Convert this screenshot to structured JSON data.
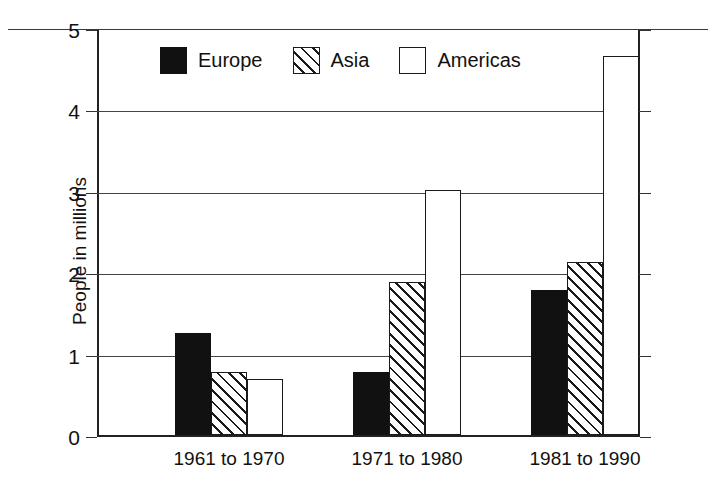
{
  "chart_data": {
    "type": "bar",
    "title": "",
    "subtitle": "",
    "xlabel": "",
    "ylabel": "People in millions",
    "categories": [
      "1961 to 1970",
      "1971 to 1980",
      "1981 to 1990"
    ],
    "series": [
      {
        "name": "Europe",
        "values": [
          1.28,
          0.8,
          1.8
        ],
        "fill": "solid-black"
      },
      {
        "name": "Asia",
        "values": [
          0.8,
          1.9,
          2.15
        ],
        "fill": "diagonal-hatch"
      },
      {
        "name": "Americas",
        "values": [
          0.71,
          3.04,
          4.68
        ],
        "fill": "white-outline"
      }
    ],
    "ylim": [
      0,
      5
    ],
    "yticks": [
      0,
      1,
      2,
      3,
      4,
      5
    ],
    "ytick_labels": [
      "0",
      "1",
      "2",
      "3",
      "4",
      "5"
    ],
    "grid": true,
    "grid_axis": "y",
    "legend_position": "top-left-inside",
    "colors": {
      "europe": "#111111",
      "asia": "#ffffff",
      "americas": "#ffffff",
      "outline": "#1a1a1a",
      "axis": "#222222",
      "gridline": "#444444",
      "background": "#ffffff",
      "text": "#111111"
    }
  },
  "legend": {
    "items": [
      {
        "label": "Europe",
        "swatch": "solid-black-swatch"
      },
      {
        "label": "Asia",
        "swatch": "hatched-swatch"
      },
      {
        "label": "Americas",
        "swatch": "empty-swatch"
      }
    ]
  }
}
